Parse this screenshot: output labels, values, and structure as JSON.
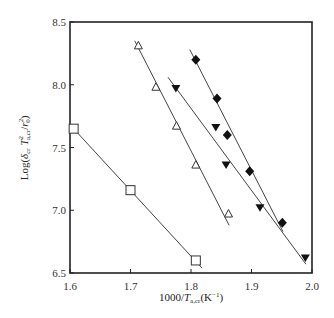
{
  "chart_data": {
    "type": "scatter",
    "title": "",
    "xlabel": "1000/T_a,cr (K^-1)",
    "ylabel": "Log(δ_cr T²_a,cr / r_0²)",
    "xlim": [
      1.6,
      2.0
    ],
    "ylim": [
      6.5,
      8.5
    ],
    "xticks": [
      "1.6",
      "1.7",
      "1.8",
      "1.9",
      "2.0"
    ],
    "yticks": [
      "6.5",
      "7.0",
      "7.5",
      "8.0",
      "8.5"
    ],
    "grid": false,
    "legend": "none",
    "series": [
      {
        "name": "open squares",
        "marker": "square-open",
        "points": [
          [
            1.606,
            7.65
          ],
          [
            1.7,
            7.16
          ],
          [
            1.808,
            6.6
          ]
        ],
        "fit_line": [
          [
            1.606,
            7.65
          ],
          [
            1.818,
            6.54
          ]
        ]
      },
      {
        "name": "open triangles",
        "marker": "triangle-up-open",
        "points": [
          [
            1.713,
            8.31
          ],
          [
            1.742,
            7.98
          ],
          [
            1.776,
            7.67
          ],
          [
            1.808,
            7.36
          ],
          [
            1.862,
            6.97
          ]
        ],
        "fit_line": [
          [
            1.707,
            8.35
          ],
          [
            1.863,
            6.88
          ]
        ]
      },
      {
        "name": "filled down-triangles",
        "marker": "triangle-down-filled",
        "points": [
          [
            1.775,
            7.97
          ],
          [
            1.841,
            7.66
          ],
          [
            1.858,
            7.36
          ],
          [
            1.914,
            7.02
          ],
          [
            1.989,
            6.62
          ]
        ],
        "fit_line": [
          [
            1.762,
            8.06
          ],
          [
            1.99,
            6.57
          ]
        ]
      },
      {
        "name": "filled diamonds",
        "marker": "diamond-filled",
        "points": [
          [
            1.808,
            8.2
          ],
          [
            1.843,
            7.89
          ],
          [
            1.86,
            7.6
          ],
          [
            1.897,
            7.31
          ],
          [
            1.951,
            6.9
          ]
        ],
        "fit_line": [
          [
            1.798,
            8.28
          ],
          [
            1.952,
            6.83
          ]
        ]
      }
    ]
  }
}
